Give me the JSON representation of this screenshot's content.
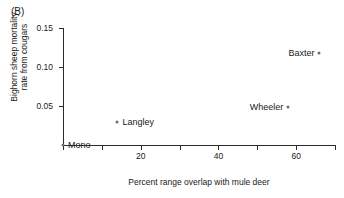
{
  "panel": {
    "label": "(B)"
  },
  "chart_data": {
    "type": "scatter",
    "title": "",
    "subtitle": "",
    "xlabel": "Percent range overlap with mule deer",
    "ylabel_line1": "Bighorn sheep mortality",
    "ylabel_line2": "rate from cougars",
    "xlim": [
      0,
      70
    ],
    "ylim": [
      0,
      0.15
    ],
    "grid": false,
    "legend": "none",
    "xticks": [
      0,
      10,
      20,
      30,
      40,
      50,
      60,
      70
    ],
    "xticklabels": [
      "",
      "",
      "20",
      "",
      "40",
      "",
      "60",
      ""
    ],
    "yticks": [
      0.05,
      0.1,
      0.15
    ],
    "yticklabels": [
      "0.05",
      "0.10",
      "0.15"
    ],
    "points": [
      {
        "name": "Mono",
        "x": 0,
        "y": 0.0,
        "label_side": "right"
      },
      {
        "name": "Langley",
        "x": 14,
        "y": 0.03,
        "label_side": "right"
      },
      {
        "name": "Wheeler",
        "x": 58,
        "y": 0.049,
        "label_side": "left"
      },
      {
        "name": "Baxter",
        "x": 66,
        "y": 0.118,
        "label_side": "left"
      }
    ],
    "colors": {
      "marker": "#6e6e6e",
      "axis": "#2b2b2b",
      "text": "#1a1a1a",
      "background": "#ffffff"
    }
  }
}
